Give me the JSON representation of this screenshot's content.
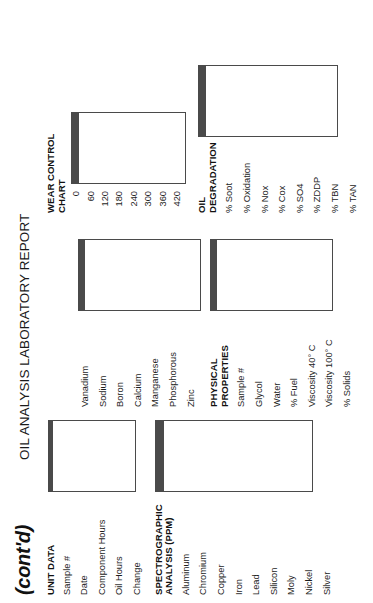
{
  "page": {
    "continued_marker": "(cont'd)",
    "title": "OIL ANALYSIS LABORATORY REPORT"
  },
  "columns": {
    "left": {
      "unit_data": {
        "heading": "UNIT DATA",
        "rows": [
          "Sample #",
          "Date",
          "Component Hours",
          "Oil Hours",
          "Change"
        ],
        "grid": {
          "rows": 5,
          "cols": 4
        }
      },
      "spectrographic": {
        "heading": "SPECTROGRAPHIC\nANALYSIS (PPM)",
        "rows": [
          "Aluminum",
          "Chromium",
          "Copper",
          "Iron",
          "Lead",
          "Silicon",
          "Moly",
          "Nickel",
          "Silver"
        ],
        "grid": {
          "rows": 9,
          "cols": 4
        }
      }
    },
    "middle": {
      "spectrographic_cont": {
        "heading": "",
        "rows": [
          "Vanadium",
          "Sodium",
          "Boron",
          "Calcium",
          "Manganese",
          "Phosphorous",
          "Zinc"
        ],
        "grid": {
          "rows": 7,
          "cols": 4
        }
      },
      "physical_properties": {
        "heading": "PHYSICAL\nPROPERTIES",
        "rows": [
          "Sample #",
          "Glycol",
          "Water",
          "% Fuel",
          "Viscosity 40° C",
          "Viscosity 100° C",
          "% Solids"
        ],
        "grid": {
          "rows": 7,
          "cols": 4
        }
      }
    },
    "right": {
      "wear_control_chart": {
        "heading": "WEAR CONTROL\nCHART",
        "axis_ticks": [
          "0",
          "60",
          "120",
          "180",
          "240",
          "300",
          "360",
          "420"
        ],
        "grid": {
          "rows": 8,
          "cols": 4
        }
      },
      "oil_degradation": {
        "heading": "OIL\nDEGRADATION",
        "rows": [
          "% Soot",
          "% Oxidation",
          "% Nox",
          "% Cox",
          "% SO4",
          "% ZDDP",
          "% TBN",
          "% TAN"
        ],
        "grid": {
          "rows": 8,
          "cols": 4
        }
      }
    }
  },
  "colors": {
    "rule": "#4a4a4a",
    "text": "#1a1a1a",
    "paper": "#ffffff"
  }
}
